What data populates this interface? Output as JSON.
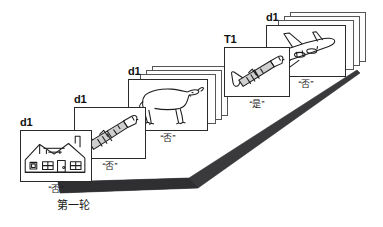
{
  "figure": {
    "caption": "第一轮",
    "caption_note": "First round trial sequence"
  },
  "ramp": {
    "color": "#3a3a3c",
    "description": "dark inclined ramp rising left-to-right"
  },
  "items": [
    {
      "id": "house",
      "tag": "d1",
      "picture": "house-icon",
      "answer": "“否”",
      "stack_count": 1
    },
    {
      "id": "trumpet-1",
      "tag": "d1",
      "picture": "trumpet-icon",
      "answer": "“否”",
      "stack_count": 1
    },
    {
      "id": "goat",
      "tag": "d1",
      "picture": "goat-icon",
      "answer": "“否”",
      "stack_count": 4
    },
    {
      "id": "trumpet-target",
      "tag": "T1",
      "picture": "trumpet-icon",
      "answer": "“是”",
      "stack_count": 1
    },
    {
      "id": "airplane",
      "tag": "d1",
      "picture": "airplane-icon",
      "answer": "“否”",
      "stack_count": 4
    }
  ]
}
